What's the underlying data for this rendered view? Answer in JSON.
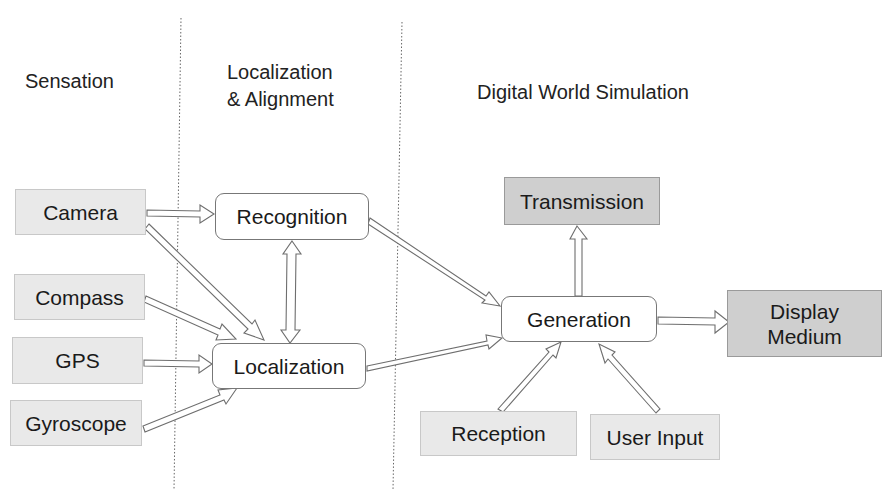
{
  "columns": {
    "sensation": "Sensation",
    "localization_line1": "Localization",
    "localization_line2": "& Alignment",
    "simulation": "Digital World Simulation"
  },
  "nodes": {
    "camera": "Camera",
    "compass": "Compass",
    "gps": "GPS",
    "gyroscope": "Gyroscope",
    "recognition": "Recognition",
    "localization": "Localization",
    "transmission": "Transmission",
    "generation": "Generation",
    "display_line1": "Display",
    "display_line2": "Medium",
    "reception": "Reception",
    "user_input": "User Input"
  },
  "edges": [
    {
      "from": "Camera",
      "to": "Recognition"
    },
    {
      "from": "Camera",
      "to": "Localization"
    },
    {
      "from": "Compass",
      "to": "Localization"
    },
    {
      "from": "GPS",
      "to": "Localization"
    },
    {
      "from": "Gyroscope",
      "to": "Localization"
    },
    {
      "from": "Recognition",
      "to": "Localization",
      "bidirectional": true
    },
    {
      "from": "Recognition",
      "to": "Generation"
    },
    {
      "from": "Localization",
      "to": "Generation"
    },
    {
      "from": "Generation",
      "to": "Transmission"
    },
    {
      "from": "Generation",
      "to": "Display Medium"
    },
    {
      "from": "Reception",
      "to": "Generation"
    },
    {
      "from": "User Input",
      "to": "Generation"
    }
  ],
  "colors": {
    "sensor_fill": "#e9e9e9",
    "output_fill": "#cfcfcf",
    "process_fill": "#ffffff",
    "arrow_stroke": "#6e6e6e"
  }
}
